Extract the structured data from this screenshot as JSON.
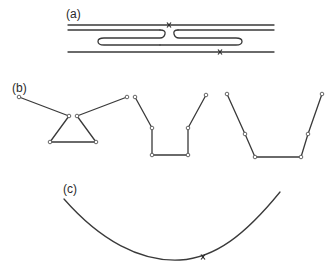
{
  "panels": {
    "a": {
      "label": "(a)",
      "description": "Two parallel strands with hairpin loops and crossover markers"
    },
    "b": {
      "label": "(b)",
      "description": "Three linked-segment chain conformations"
    },
    "c": {
      "label": "(c)",
      "description": "Smooth curved strand with a marker"
    }
  },
  "colors": {
    "line": "#3a3a3a",
    "background": "#ffffff"
  }
}
